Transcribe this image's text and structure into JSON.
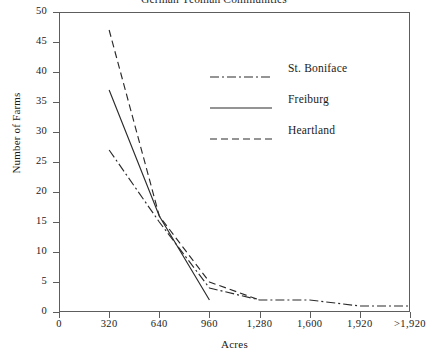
{
  "chart_data": {
    "type": "line",
    "title": "German Yeoman Communities",
    "xlabel": "Acres",
    "ylabel": "Number of Farms",
    "categories": [
      "0",
      "320",
      "640",
      "960",
      "1,280",
      "1,600",
      "1,920",
      ">1,920"
    ],
    "x_tick_labels": [
      "0",
      "320",
      "640",
      "960",
      "1,280",
      "1,600",
      "1,920",
      ">1,920"
    ],
    "y_tick_labels": [
      "0",
      "5",
      "10",
      "15",
      "20",
      "25",
      "30",
      "35",
      "40",
      "45",
      "50"
    ],
    "y_ticks": [
      0,
      5,
      10,
      15,
      20,
      25,
      30,
      35,
      40,
      45,
      50
    ],
    "ylim": [
      0,
      50
    ],
    "xlim": [
      0,
      2240
    ],
    "grid": false,
    "legend_position": "upper-right-inside",
    "series": [
      {
        "name": "St. Boniface",
        "style": "dash-dot",
        "x": [
          320,
          640,
          960,
          1280,
          1600,
          1920,
          2240
        ],
        "values": [
          27,
          15,
          4,
          2,
          2,
          1,
          1
        ]
      },
      {
        "name": "Freiburg",
        "style": "solid",
        "x": [
          320,
          640,
          960
        ],
        "values": [
          37,
          16,
          2
        ]
      },
      {
        "name": "Heartland",
        "style": "dashed",
        "x": [
          320,
          640,
          960,
          1280
        ],
        "values": [
          47,
          16,
          5,
          2
        ]
      }
    ]
  },
  "legend": {
    "entries": [
      {
        "label": "St. Boniface"
      },
      {
        "label": "Freiburg"
      },
      {
        "label": "Heartland"
      }
    ]
  },
  "colors": {
    "line": "#2b2b2b",
    "axis": "#5d5d5d",
    "text": "#1a1a1a",
    "background": "#ffffff"
  }
}
